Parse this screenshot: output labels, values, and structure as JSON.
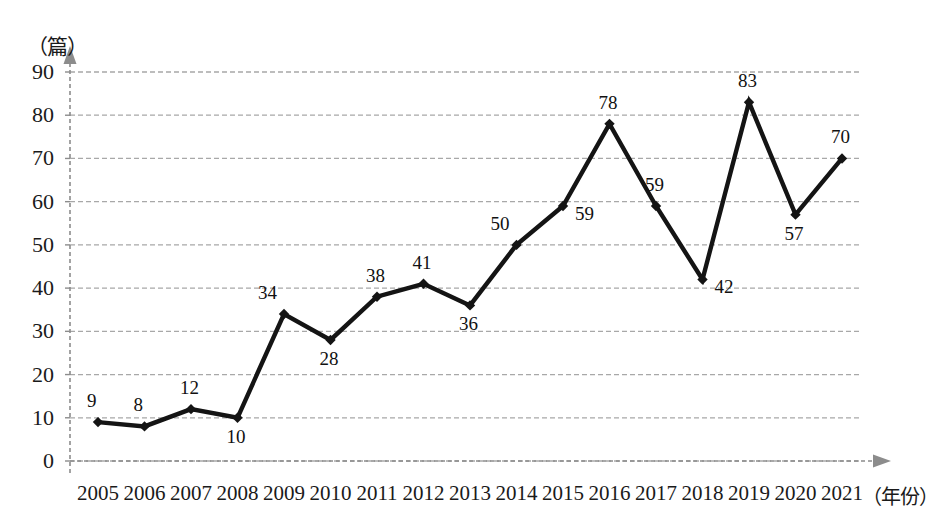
{
  "chart_data": {
    "type": "line",
    "title": "",
    "xlabel": "（年份）",
    "ylabel": "（篇）",
    "ylim": [
      0,
      90
    ],
    "y_ticks": [
      0,
      10,
      20,
      30,
      40,
      50,
      60,
      70,
      80,
      90
    ],
    "grid": true,
    "legend": "none",
    "categories": [
      "2005",
      "2006",
      "2007",
      "2008",
      "2009",
      "2010",
      "2011",
      "2012",
      "2013",
      "2014",
      "2015",
      "2016",
      "2017",
      "2018",
      "2019",
      "2020",
      "2021"
    ],
    "values": [
      9,
      8,
      12,
      10,
      34,
      28,
      38,
      41,
      36,
      50,
      59,
      78,
      59,
      42,
      83,
      57,
      70
    ],
    "point_labels": [
      {
        "year": "2005",
        "value": 9,
        "text": "9",
        "pos": "above"
      },
      {
        "year": "2006",
        "value": 8,
        "text": "8",
        "pos": "above"
      },
      {
        "year": "2007",
        "value": 12,
        "text": "12",
        "pos": "above"
      },
      {
        "year": "2008",
        "value": 10,
        "text": "10",
        "pos": "below"
      },
      {
        "year": "2009",
        "value": 34,
        "text": "34",
        "pos": "above-left"
      },
      {
        "year": "2010",
        "value": 28,
        "text": "28",
        "pos": "below"
      },
      {
        "year": "2011",
        "value": 38,
        "text": "38",
        "pos": "above"
      },
      {
        "year": "2012",
        "value": 41,
        "text": "41",
        "pos": "above"
      },
      {
        "year": "2013",
        "value": 36,
        "text": "36",
        "pos": "below"
      },
      {
        "year": "2014",
        "value": 50,
        "text": "50",
        "pos": "above-left"
      },
      {
        "year": "2015",
        "value": 59,
        "text": "59",
        "pos": "right"
      },
      {
        "year": "2016",
        "value": 78,
        "text": "78",
        "pos": "above"
      },
      {
        "year": "2017",
        "value": 59,
        "text": "59",
        "pos": "above"
      },
      {
        "year": "2018",
        "value": 42,
        "text": "42",
        "pos": "right"
      },
      {
        "year": "2019",
        "value": 83,
        "text": "83",
        "pos": "above"
      },
      {
        "year": "2020",
        "value": 57,
        "text": "57",
        "pos": "below"
      },
      {
        "year": "2021",
        "value": 70,
        "text": "70",
        "pos": "above"
      }
    ],
    "colors": {
      "series_line": "#141414",
      "marker": "#141414",
      "gridline": "#a8a8a8",
      "axis": "#8c8c8c",
      "text": "#1a1a1a"
    }
  }
}
